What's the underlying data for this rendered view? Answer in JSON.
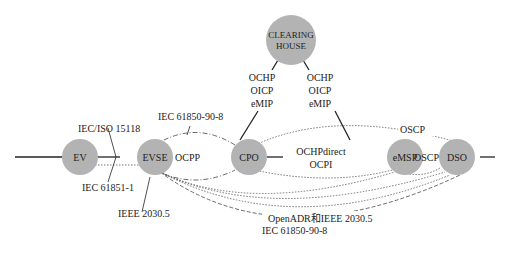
{
  "diagram": {
    "nodes": {
      "ev": "EV",
      "evse": "EVSE",
      "cpo": "CPO",
      "emsp": "eMSP",
      "dso": "DSO",
      "clearing_house_line1": "CLEARING",
      "clearing_house_line2": "HOUSE"
    },
    "labels": {
      "iec_iso_15118": "IEC/ISO 15118",
      "iec_61851_1": "IEC 61851-1",
      "ieee_2030_5": "IEEE 2030.5",
      "iec_61850_90_8_top": "IEC 61850-90-8",
      "ocpp": "OCPP",
      "ch_cpo_1": "OCHP",
      "ch_cpo_2": "OICP",
      "ch_cpo_3": "eMIP",
      "ch_emsp_1": "OCHP",
      "ch_emsp_2": "OICP",
      "ch_emsp_3": "eMIP",
      "cpo_emsp_1": "OCHPdirect",
      "cpo_emsp_2": "OCPI",
      "oscp_top": "OSCP",
      "oscp_mid": "OSCP",
      "openadr": "OpenADR和IEEE 2030.5",
      "iec_61850_90_8_bottom": "IEC 61850-90-8"
    }
  }
}
